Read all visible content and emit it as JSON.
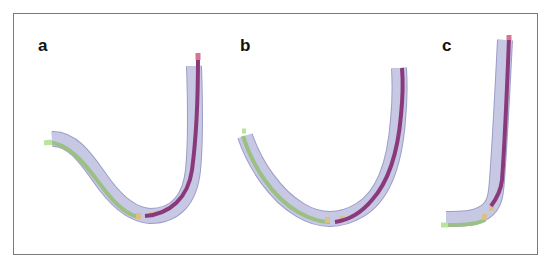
{
  "figure": {
    "panels": [
      {
        "label": "a",
        "shape": "s-curve-hook"
      },
      {
        "label": "b",
        "shape": "u-curve"
      },
      {
        "label": "c",
        "shape": "j-curve"
      }
    ]
  },
  "colors": {
    "frame": "#7a7a7a",
    "sheath_fill": "#c7c8e4",
    "sheath_stroke": "#9b9dc8",
    "green_segment": "#9cbf84",
    "green_tip": "#b9e59a",
    "purple_segment": "#8a3a7a",
    "pink_tip": "#d9738f",
    "joint_marker": "#d9c089",
    "label_text": "#111111"
  }
}
